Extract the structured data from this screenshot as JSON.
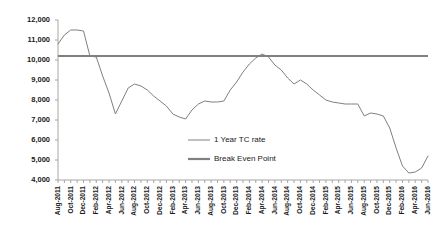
{
  "chart_data": {
    "type": "line",
    "title": "",
    "xlabel": "",
    "ylabel": "",
    "ylim": [
      4000,
      12000
    ],
    "y_ticks": [
      4000,
      5000,
      6000,
      7000,
      8000,
      9000,
      10000,
      11000,
      12000
    ],
    "y_tick_labels": [
      "4,000",
      "5,000",
      "6,000",
      "7,000",
      "8,000",
      "9,000",
      "10,000",
      "11,000",
      "12,000"
    ],
    "grid": false,
    "legend_position": "center",
    "x": [
      "Aug-2011",
      "Sep-2011",
      "Oct-2011",
      "Nov-2011",
      "Dec-2011",
      "Jan-2012",
      "Feb-2012",
      "Mar-2012",
      "Apr-2012",
      "May-2012",
      "Jun-2012",
      "Jul-2012",
      "Aug-2012",
      "Sep-2012",
      "Oct-2012",
      "Nov-2012",
      "Dec-2012",
      "Jan-2013",
      "Feb-2013",
      "Mar-2013",
      "Apr-2013",
      "May-2013",
      "Jun-2013",
      "Jul-2013",
      "Aug-2013",
      "Sep-2013",
      "Oct-2013",
      "Nov-2013",
      "Dec-2013",
      "Jan-2014",
      "Feb-2014",
      "Mar-2014",
      "Apr-2014",
      "May-2014",
      "Jun-2014",
      "Jul-2014",
      "Aug-2014",
      "Sep-2014",
      "Oct-2014",
      "Nov-2014",
      "Dec-2014",
      "Jan-2015",
      "Feb-2015",
      "Mar-2015",
      "Apr-2015",
      "May-2015",
      "Jun-2015",
      "Jul-2015",
      "Aug-2015",
      "Sep-2015",
      "Oct-2015",
      "Nov-2015",
      "Dec-2015",
      "Jan-2016",
      "Feb-2016",
      "Mar-2016",
      "Apr-2016",
      "May-2016",
      "Jun-2016"
    ],
    "x_tick_labels": [
      "Aug-2011",
      "Oct-2011",
      "Dec-2011",
      "Feb-2012",
      "Apr-2012",
      "Jun-2012",
      "Aug-2012",
      "Oct-2012",
      "Dec-2012",
      "Feb-2013",
      "Apr-2013",
      "Jun-2013",
      "Aug-2013",
      "Oct-2013",
      "Dec-2013",
      "Feb-2014",
      "Apr-2014",
      "Jun-2014",
      "Aug-2014",
      "Oct-2014",
      "Dec-2014",
      "Feb-2015",
      "Apr-2015",
      "Jun-2015",
      "Aug-2015",
      "Oct-2015",
      "Dec-2015",
      "Feb-2016",
      "Apr-2016",
      "Jun-2016"
    ],
    "series": [
      {
        "name": "1 Year TC rate",
        "color": "#808080",
        "values": [
          10800,
          11250,
          11500,
          11500,
          11450,
          10200,
          10150,
          9200,
          8350,
          7300,
          7950,
          8600,
          8800,
          8700,
          8500,
          8200,
          7950,
          7700,
          7300,
          7150,
          7050,
          7500,
          7800,
          7950,
          7900,
          7900,
          7950,
          8500,
          8900,
          9400,
          9800,
          10100,
          10300,
          10150,
          9750,
          9500,
          9100,
          8800,
          9000,
          8800,
          8500,
          8250,
          8000,
          7900,
          7850,
          7800,
          7800,
          7800,
          7200,
          7350,
          7300,
          7200,
          6600,
          5600,
          4700,
          4350,
          4400,
          4600,
          5200
        ]
      },
      {
        "name": "Break Even Point",
        "color": "#808080",
        "constant": 10200
      }
    ],
    "legend": [
      {
        "label": "1 Year TC rate",
        "style": "thin"
      },
      {
        "label": "Break Even Point",
        "style": "thick"
      }
    ]
  },
  "axes": {
    "plot_left": 58,
    "plot_right": 428,
    "plot_top": 20,
    "plot_bottom": 180
  }
}
